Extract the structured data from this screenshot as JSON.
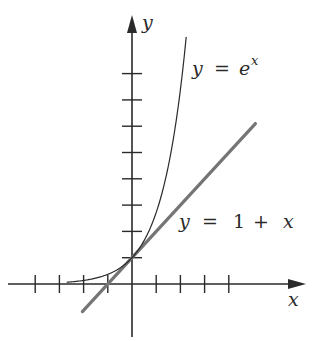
{
  "chart_data": {
    "type": "line",
    "title": "",
    "xlabel": "x",
    "ylabel": "y",
    "grid": false,
    "legend": "inline annotations",
    "xlim": [
      -4.1,
      7.3
    ],
    "ylim": [
      -2.0,
      10.8
    ],
    "x_ticks": [
      -4,
      -3,
      -2,
      -1,
      1,
      2,
      3,
      4
    ],
    "y_ticks": [
      1,
      2,
      3,
      4,
      5,
      6,
      7,
      8
    ],
    "tick_labels_shown": false,
    "series": [
      {
        "name": "y = e^x",
        "color": "#2a2a2a",
        "function": "exp(x)",
        "x": [
          -2.7,
          -2,
          -1.5,
          -1,
          -0.5,
          0,
          0.5,
          1,
          1.5,
          2,
          2.24
        ],
        "values": [
          0.07,
          0.14,
          0.22,
          0.37,
          0.61,
          1.0,
          1.65,
          2.72,
          4.48,
          7.39,
          9.35
        ]
      },
      {
        "name": "y = 1 + x",
        "color": "#757575",
        "function": "1 + x",
        "x": [
          -2.05,
          5.1
        ],
        "values": [
          -1.05,
          6.1
        ]
      }
    ],
    "annotations": [
      {
        "text": "y = e^x",
        "near": [
          2.4,
          8.1
        ]
      },
      {
        "text": "y = 1 + x",
        "near": [
          2.0,
          2.1
        ]
      }
    ]
  },
  "labels": {
    "x_axis": "x",
    "y_axis": "y",
    "curve_label": {
      "y": "y",
      "eq": "=",
      "base": "e",
      "exp": "x"
    },
    "line_label": {
      "y": "y",
      "eq": "=",
      "one": "1",
      "plus": "+",
      "x": "x"
    }
  }
}
